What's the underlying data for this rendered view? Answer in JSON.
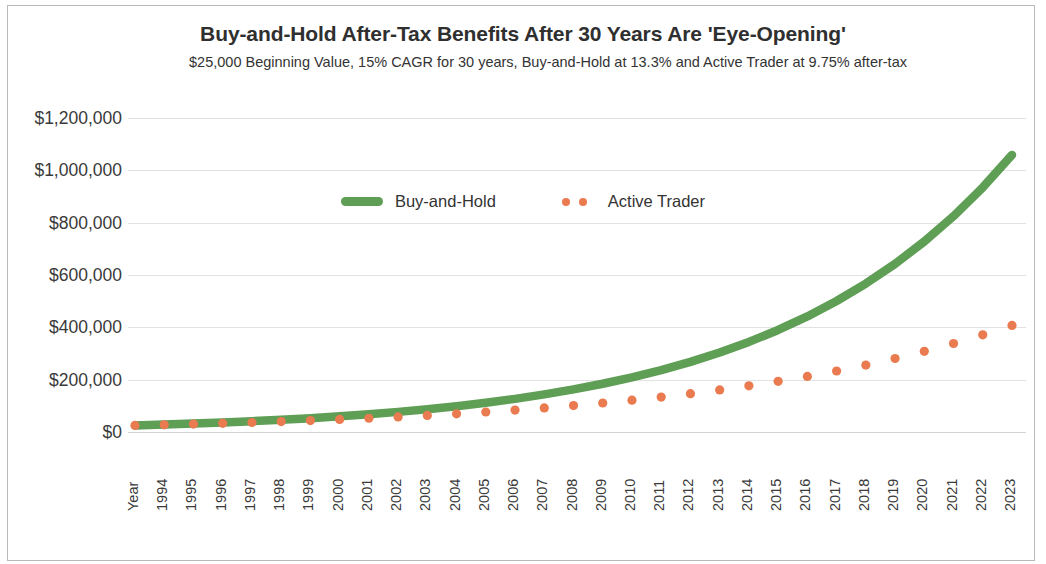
{
  "chart_data": {
    "type": "line",
    "title": "Buy-and-Hold After-Tax Benefits After 30 Years Are 'Eye-Opening'",
    "subtitle": "$25,000 Beginning Value, 15% CAGR for 30 years, Buy-and-Hold at 13.3% and Active Trader at 9.75% after-tax",
    "xlabel": "Year",
    "ylabel": "",
    "ylim": [
      0,
      1200000
    ],
    "ytick_labels": [
      "$1,200,000",
      "$1,000,000",
      "$800,000",
      "$600,000",
      "$400,000",
      "$200,000",
      "$0"
    ],
    "ytick_values": [
      1200000,
      1000000,
      800000,
      600000,
      400000,
      200000,
      0
    ],
    "grid": true,
    "legend_position": "inside-top-center",
    "categories": [
      "Year",
      "1994",
      "1995",
      "1996",
      "1997",
      "1998",
      "1999",
      "2000",
      "2001",
      "2002",
      "2003",
      "2004",
      "2005",
      "2006",
      "2007",
      "2008",
      "2009",
      "2010",
      "2011",
      "2012",
      "2013",
      "2014",
      "2015",
      "2016",
      "2017",
      "2018",
      "2019",
      "2020",
      "2021",
      "2022",
      "2023"
    ],
    "series": [
      {
        "name": "Buy-and-Hold",
        "color": "#5f9e55",
        "style": "thick-line",
        "cagr": 0.133,
        "start_value": 25000,
        "values": [
          25000,
          28325,
          32092,
          36360,
          41196,
          46675,
          52883,
          59916,
          67885,
          76914,
          87144,
          98734,
          111866,
          126744,
          143601,
          162700,
          184339,
          208856,
          236634,
          268106,
          303764,
          344165,
          389939,
          441801,
          500561,
          567136,
          642565,
          728026,
          824853,
          934558,
          1058854
        ]
      },
      {
        "name": "Active Trader",
        "color": "#ea7a4f",
        "style": "dotted",
        "cagr": 0.0975,
        "start_value": 25000,
        "values": [
          25000,
          27438,
          30113,
          33049,
          36270,
          39806,
          43688,
          47948,
          52623,
          57754,
          63385,
          69565,
          76348,
          83792,
          91962,
          100928,
          110768,
          121568,
          133421,
          146429,
          160706,
          176375,
          193572,
          212445,
          233158,
          255891,
          280840,
          308222,
          338274,
          371255,
          407452
        ]
      }
    ]
  },
  "ytick_labels": [
    "$1,200,000",
    "$1,000,000",
    "$800,000",
    "$600,000",
    "$400,000",
    "$200,000",
    "$0"
  ],
  "xtick_labels": [
    "Year",
    "1994",
    "1995",
    "1996",
    "1997",
    "1998",
    "1999",
    "2000",
    "2001",
    "2002",
    "2003",
    "2004",
    "2005",
    "2006",
    "2007",
    "2008",
    "2009",
    "2010",
    "2011",
    "2012",
    "2013",
    "2014",
    "2015",
    "2016",
    "2017",
    "2018",
    "2019",
    "2020",
    "2021",
    "2022",
    "2023"
  ],
  "legend": {
    "buy_and_hold": "Buy-and-Hold",
    "active_trader": "Active Trader"
  },
  "colors": {
    "buy_and_hold": "#5f9e55",
    "active_trader": "#ea7a4f",
    "grid": "#e2e2e2",
    "text": "#333333",
    "border": "#b9b9b9"
  }
}
